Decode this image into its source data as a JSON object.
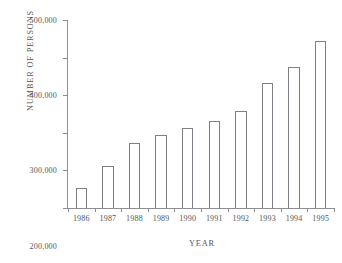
{
  "chart_data": {
    "type": "bar",
    "title": "",
    "xlabel": "YEAR",
    "ylabel": "NUMBER OF PERSONS",
    "categories": [
      "1986",
      "1987",
      "1988",
      "1989",
      "1990",
      "1991",
      "1992",
      "1993",
      "1994",
      "1995"
    ],
    "values": [
      53000,
      112000,
      173000,
      195000,
      212000,
      231000,
      257000,
      333000,
      376000,
      445000
    ],
    "ylim": [
      0,
      500000
    ],
    "ytick_values": [
      0,
      100000,
      200000,
      300000,
      400000,
      500000
    ],
    "ytick_labels": [
      "0",
      "100,000",
      "200,000",
      "300,000",
      "400,000",
      "500,000"
    ],
    "grid": false,
    "legend": null,
    "bar_fill_color": "#ffffff",
    "bar_edge_color": "#7f7f86",
    "axis_color": "#8d8d92",
    "background_color": "#ffffff"
  }
}
